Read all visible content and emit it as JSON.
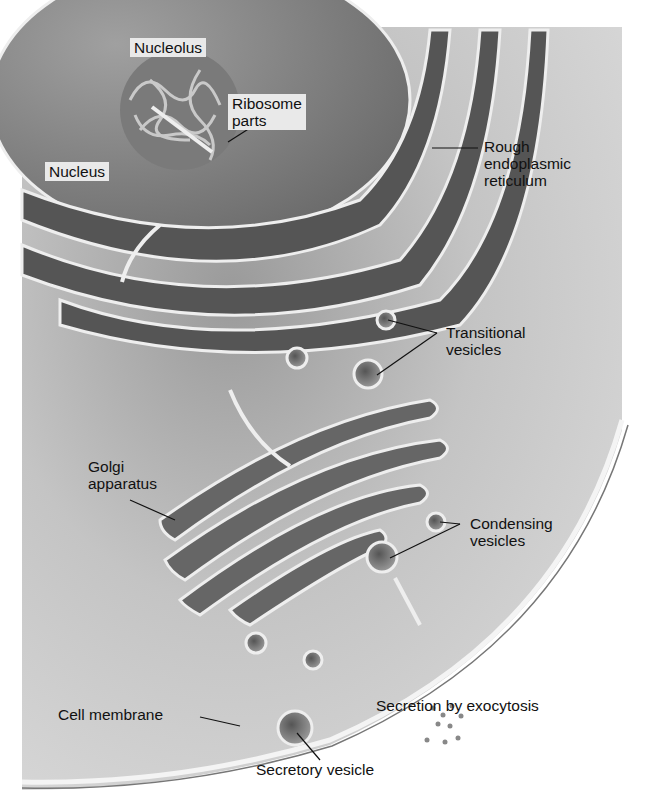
{
  "diagram": {
    "colors": {
      "background": "#ffffff",
      "cytoplasm": "#cfcfcf",
      "nucleus": "#8a8a8a",
      "membrane": "#f2f2f2",
      "label_text": "#111111",
      "label_box": "#e9e9e9"
    },
    "labels": {
      "nucleolus": "Nucleolus",
      "ribosome_parts": [
        "Ribosome",
        "parts"
      ],
      "nucleus": "Nucleus",
      "rough_er": [
        "Rough",
        "endoplasmic",
        "reticulum"
      ],
      "transitional_vesicles": [
        "Transitional",
        "vesicles"
      ],
      "golgi": [
        "Golgi",
        "apparatus"
      ],
      "condensing_vesicles": [
        "Condensing",
        "vesicles"
      ],
      "cell_membrane": "Cell membrane",
      "secretion": "Secretion by exocytosis",
      "secretory_vesicle": "Secretory vesicle"
    }
  }
}
